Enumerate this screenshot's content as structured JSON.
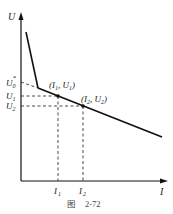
{
  "figure": {
    "caption": "图　2-72",
    "axes": {
      "y_label": "U",
      "x_label": "I"
    },
    "y_ticks": {
      "u0_star": "U",
      "u0_sub": "0",
      "u0_sup": "*",
      "u1": "U",
      "u1_sub": "1",
      "u2": "U",
      "u2_sub": "2"
    },
    "x_ticks": {
      "i1": "I",
      "i1_sub": "1",
      "i2": "I",
      "i2_sub": "2"
    },
    "points": [
      {
        "label_open": "(",
        "i": "I",
        "i_sub": "1",
        "sep": ", ",
        "u": "U",
        "u_sub": "1",
        "label_close": ")"
      },
      {
        "label_open": "(",
        "i": "I",
        "i_sub": "2",
        "sep": ", ",
        "u": "U",
        "u_sub": "2",
        "label_close": ")"
      }
    ],
    "colors": {
      "line": "#111111",
      "dash": "#333333",
      "text": "#222222"
    }
  }
}
